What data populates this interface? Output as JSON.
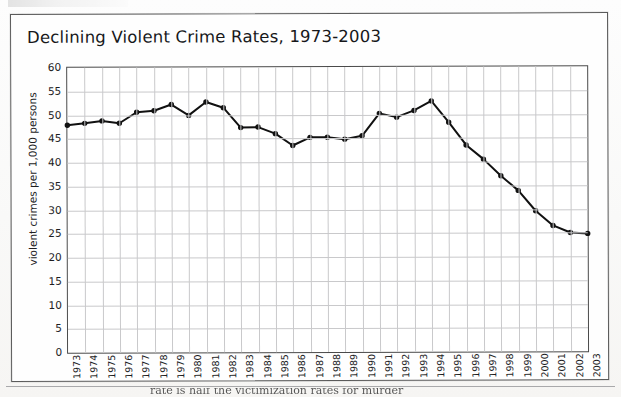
{
  "document": {
    "top_cut_text": "",
    "bottom_cut_text": "rate is half the victimization rates for murder"
  },
  "figure": {
    "title": "Declining Violent Crime Rates, 1973-2003"
  },
  "chart_data": {
    "type": "line",
    "title": "Declining Violent Crime Rates, 1973-2003",
    "xlabel": "",
    "ylabel": "violent crimes per 1,000 persons",
    "ylim": [
      0,
      60
    ],
    "ytick_step": 5,
    "yticks": [
      0,
      5,
      10,
      15,
      20,
      25,
      30,
      35,
      40,
      45,
      50,
      55,
      60
    ],
    "grid": "both",
    "legend": "none",
    "marker": "filled-circle",
    "line_color": "#111111",
    "grid_color": "#c9c9cb",
    "categories": [
      "1973",
      "1974",
      "1975",
      "1976",
      "1977",
      "1978",
      "1979",
      "1980",
      "1981",
      "1982",
      "1983",
      "1984",
      "1985",
      "1986",
      "1987",
      "1988",
      "1989",
      "1990",
      "1991",
      "1992",
      "1993",
      "1994",
      "1995",
      "1996",
      "1997",
      "1998",
      "1999",
      "2000",
      "2001",
      "2002",
      "2003"
    ],
    "values": [
      47.9,
      48.3,
      48.8,
      48.3,
      50.6,
      50.9,
      52.2,
      49.9,
      52.7,
      51.5,
      47.3,
      47.4,
      46.0,
      43.5,
      45.2,
      45.2,
      44.8,
      45.5,
      50.2,
      49.4,
      50.8,
      52.8,
      48.3,
      43.5,
      40.5,
      37.0,
      33.9,
      29.6,
      26.5,
      25.0,
      24.8
    ],
    "annotations": []
  }
}
